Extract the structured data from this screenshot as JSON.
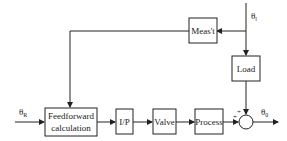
{
  "diagram": {
    "type": "feedforward control block diagram",
    "blocks": {
      "measurement": "Meas't",
      "load": "Load",
      "feedforward_line1": "Feedforward",
      "feedforward_line2": "calculation",
      "ip": "I/P",
      "valve": "Valve",
      "process": "Process"
    },
    "signals": {
      "reference": "θ",
      "reference_sub": "R",
      "load_input": "θ",
      "load_input_sub": "l",
      "output": "θ",
      "output_sub": "0"
    },
    "summing_junction": {
      "sign_top": "+",
      "sign_left": "+"
    },
    "colors": {
      "line": "#222222",
      "background": "#ffffff"
    }
  }
}
